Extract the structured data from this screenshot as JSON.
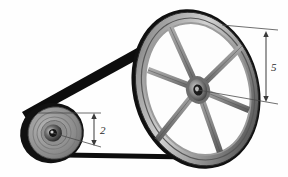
{
  "figure": {
    "type": "technical-illustration",
    "background_color": "#fefefe"
  },
  "dimensions": {
    "small_pulley_label": "2",
    "large_pulley_label": "5"
  },
  "colors": {
    "belt": "#111111",
    "rim_dark": "#3a3a3a",
    "rim_mid": "#8a8a8a",
    "rim_light": "#c9c9c9",
    "spoke": "#7e7e7e",
    "hub": "#2b2b2b",
    "leader_line": "#4a4a4a",
    "label_text": "#2a2a2a"
  },
  "parts": {
    "large_pulley_name": "flywheel",
    "small_pulley_name": "drive-pulley",
    "belt_name": "drive-belt",
    "spoke_count": 6
  }
}
